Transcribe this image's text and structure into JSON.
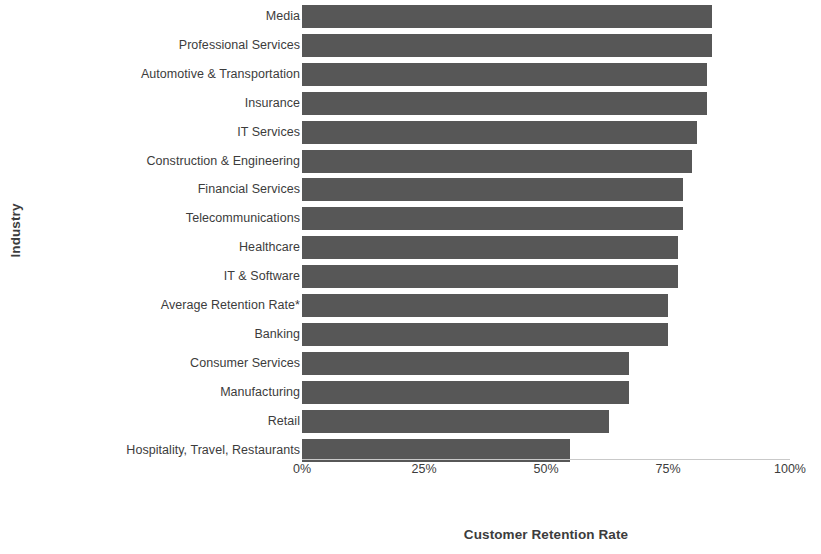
{
  "chart_data": {
    "type": "bar",
    "orientation": "horizontal",
    "title": "",
    "xlabel": "Customer Retention Rate",
    "ylabel": "Industry",
    "xlim": [
      0,
      100
    ],
    "xticks": [
      0,
      25,
      50,
      75,
      100
    ],
    "xtick_labels": [
      "0%",
      "25%",
      "50%",
      "75%",
      "100%"
    ],
    "grid": false,
    "legend": null,
    "bar_color": "#575757",
    "axis_color": "#c9c9c9",
    "text_color": "#3c3c3c",
    "categories": [
      "Media",
      "Professional Services",
      "Automotive & Transportation",
      "Insurance",
      "IT Services",
      "Construction & Engineering",
      "Financial Services",
      "Telecommunications",
      "Healthcare",
      "IT & Software",
      "Average Retention Rate*",
      "Banking",
      "Consumer Services",
      "Manufacturing",
      "Retail",
      "Hospitality, Travel, Restaurants"
    ],
    "values": [
      84,
      84,
      83,
      83,
      81,
      80,
      78,
      78,
      77,
      77,
      75,
      75,
      67,
      67,
      63,
      55
    ],
    "value_labels": [
      "84%",
      "84%",
      "83%",
      "83%",
      "81%",
      "80%",
      "78%",
      "78%",
      "77%",
      "77%",
      "75%",
      "75%",
      "67%",
      "67%",
      "63%",
      "55%"
    ]
  }
}
